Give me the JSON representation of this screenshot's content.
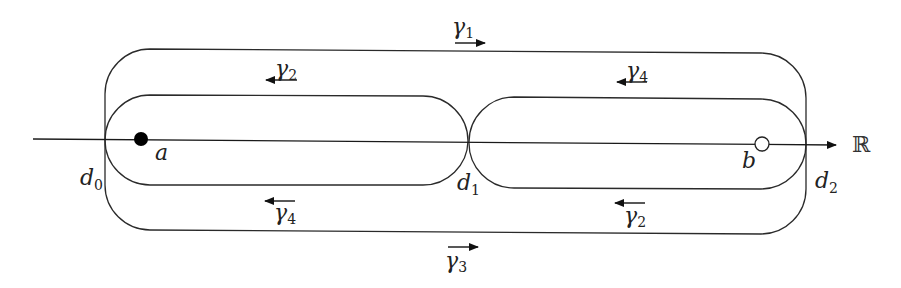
{
  "diagram": {
    "axis": {
      "label": "ℝ",
      "direction": "right"
    },
    "points": {
      "a": {
        "label": "a",
        "style": "filled"
      },
      "b": {
        "label": "b",
        "style": "open"
      }
    },
    "crossings": {
      "d0": {
        "base": "d",
        "sub": "0"
      },
      "d1": {
        "base": "d",
        "sub": "1"
      },
      "d2": {
        "base": "d",
        "sub": "2"
      }
    },
    "contours": {
      "outer": {
        "top_label": {
          "base": "γ",
          "sub": "1",
          "direction": "right"
        },
        "bottom_label": {
          "base": "γ",
          "sub": "3",
          "direction": "right"
        }
      },
      "left_inner": {
        "top_label": {
          "base": "γ",
          "sub": "2",
          "direction": "left"
        },
        "bottom_label": {
          "base": "γ",
          "sub": "4",
          "direction": "left"
        }
      },
      "right_inner": {
        "top_label": {
          "base": "γ",
          "sub": "4",
          "direction": "left"
        },
        "bottom_label": {
          "base": "γ",
          "sub": "2",
          "direction": "left"
        }
      }
    },
    "colors": {
      "stroke": "#2a2a2a",
      "background": "#ffffff"
    }
  }
}
